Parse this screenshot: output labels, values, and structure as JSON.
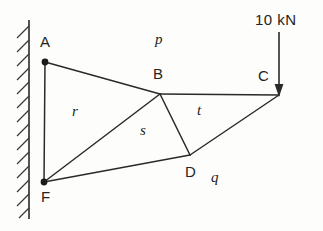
{
  "figure": {
    "background_color": "#fdfdfb",
    "line_color": "#2a2a2a",
    "wall": {
      "name": "fixed support wall",
      "line_x": 29,
      "top_y": 20,
      "bottom_y": 219,
      "hatch_width": 13,
      "hatch_side": "left"
    },
    "nodes": [
      {
        "id": "A",
        "label": "A",
        "x": 45,
        "y": 62,
        "label_x": 40,
        "label_y": 34,
        "pinned": true
      },
      {
        "id": "B",
        "label": "B",
        "x": 160,
        "y": 94,
        "label_x": 153,
        "label_y": 66,
        "pinned": false
      },
      {
        "id": "C",
        "label": "C",
        "x": 279,
        "y": 95,
        "label_x": 258,
        "label_y": 68,
        "pinned": false
      },
      {
        "id": "D",
        "label": "D",
        "x": 190,
        "y": 155,
        "label_x": 185,
        "label_y": 164,
        "pinned": false
      },
      {
        "id": "F",
        "label": "F",
        "x": 44,
        "y": 182,
        "label_x": 41,
        "label_y": 189,
        "pinned": true
      }
    ],
    "members": [
      {
        "name": "member-A-B",
        "from": "A",
        "to": "B"
      },
      {
        "name": "member-B-C",
        "from": "B",
        "to": "C"
      },
      {
        "name": "member-A-F",
        "from": "A",
        "to": "F"
      },
      {
        "name": "member-F-B",
        "from": "F",
        "to": "B"
      },
      {
        "name": "member-B-D",
        "from": "B",
        "to": "D"
      },
      {
        "name": "member-F-D",
        "from": "F",
        "to": "D"
      },
      {
        "name": "member-D-C",
        "from": "D",
        "to": "C"
      }
    ],
    "region_labels": [
      {
        "id": "p",
        "text": "p",
        "x": 155,
        "y": 32
      },
      {
        "id": "r",
        "text": "r",
        "x": 72,
        "y": 104
      },
      {
        "id": "s",
        "text": "s",
        "x": 140,
        "y": 123
      },
      {
        "id": "t",
        "text": "t",
        "x": 197,
        "y": 103
      },
      {
        "id": "q",
        "text": "q",
        "x": 211,
        "y": 170
      }
    ],
    "load": {
      "name": "applied-load",
      "text": "10 kN",
      "text_x": 255,
      "text_y": 12,
      "arrow_x": 279,
      "arrow_top_y": 32,
      "arrow_tip_y": 95,
      "direction": "down",
      "magnitude": 10,
      "unit": "kN"
    }
  }
}
